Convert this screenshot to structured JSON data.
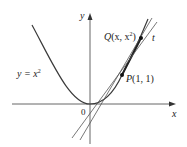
{
  "diagram": {
    "curve_label": "y = x",
    "curve_label_exp": "2",
    "axis_x_label": "x",
    "axis_y_label": "y",
    "origin_label": "0",
    "point_p": {
      "name": "P",
      "coords": "(1, 1)"
    },
    "point_q": {
      "name": "Q",
      "coords_open": "(x, x",
      "coords_exp": "2",
      "coords_close": ")"
    },
    "tangent_label": "t",
    "colors": {
      "curve": "#3a3a3a",
      "axis": "#555555",
      "line": "#555555",
      "text": "#222222"
    }
  }
}
